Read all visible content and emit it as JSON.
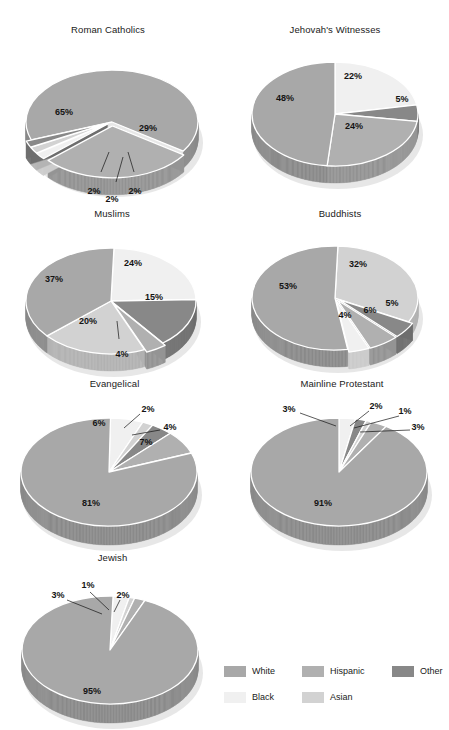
{
  "header": {
    "cut_text": ""
  },
  "legend": {
    "rows": [
      [
        {
          "label": "White",
          "key": "white"
        },
        {
          "label": "Hispanic",
          "key": "hispanic"
        },
        {
          "label": "Other",
          "key": "other"
        }
      ],
      [
        {
          "label": "Black",
          "key": "black"
        },
        {
          "label": "Asian",
          "key": "asian"
        }
      ]
    ]
  },
  "colors": {
    "white": "#a8a8a8",
    "black": "#f0f0f0",
    "hispanic": "#b0b0b0",
    "asian": "#d2d2d2",
    "other": "#888888",
    "white_side": "#8c8c8c",
    "black_side": "#cccccc",
    "hispanic_side": "#949494",
    "asian_side": "#b4b4b4",
    "other_side": "#6e6e6e",
    "edge": "#ffffff",
    "text": "#141414"
  },
  "chart_data": [
    {
      "type": "pie",
      "title": "Roman Catholics",
      "categories": [
        "White",
        "Hispanic",
        "Black",
        "Asian",
        "Other"
      ],
      "values": [
        65,
        29,
        2,
        2,
        2
      ],
      "labels": [
        "65%",
        "29%",
        "2%",
        "2%",
        "2%"
      ],
      "exploded": [
        false,
        true,
        true,
        true,
        true
      ],
      "note": "3-D pie; small slices labeled with leader lines below"
    },
    {
      "type": "pie",
      "title": "Jehovah's Witnesses",
      "categories": [
        "Black",
        "Other",
        "Hispanic",
        "White"
      ],
      "values": [
        22,
        5,
        24,
        48
      ],
      "labels": [
        "22%",
        "5%",
        "24%",
        "48%"
      ],
      "exploded": [
        false,
        false,
        false,
        false
      ]
    },
    {
      "type": "pie",
      "title": "Muslims",
      "categories": [
        "Black",
        "Other",
        "Hispanic",
        "Asian",
        "White"
      ],
      "values": [
        24,
        15,
        4,
        20,
        37
      ],
      "labels": [
        "24%",
        "15%",
        "4%",
        "20%",
        "37%"
      ],
      "exploded": [
        false,
        false,
        true,
        false,
        false
      ]
    },
    {
      "type": "pie",
      "title": "Buddhists",
      "categories": [
        "Asian",
        "Other",
        "Hispanic",
        "Black",
        "White"
      ],
      "values": [
        32,
        5,
        6,
        4,
        53
      ],
      "labels": [
        "32%",
        "5%",
        "6%",
        "4%",
        "53%"
      ],
      "exploded": [
        false,
        true,
        true,
        true,
        false
      ]
    },
    {
      "type": "pie",
      "title": "Evangelical",
      "categories": [
        "Black",
        "Asian",
        "Other",
        "Hispanic",
        "White"
      ],
      "values": [
        6,
        2,
        4,
        7,
        81
      ],
      "labels": [
        "6%",
        "2%",
        "4%",
        "7%",
        "81%"
      ],
      "exploded": [
        false,
        false,
        false,
        false,
        false
      ]
    },
    {
      "type": "pie",
      "title": "Mainline Protestant",
      "categories": [
        "Black",
        "Other",
        "Asian",
        "Hispanic",
        "White"
      ],
      "values": [
        3,
        2,
        1,
        3,
        91
      ],
      "labels": [
        "3%",
        "2%",
        "1%",
        "3%",
        "91%"
      ],
      "exploded": [
        false,
        false,
        false,
        false,
        false
      ]
    },
    {
      "type": "pie",
      "title": "Jewish",
      "categories": [
        "Black",
        "Asian",
        "Hispanic",
        "White"
      ],
      "values": [
        3,
        1,
        2,
        95
      ],
      "labels": [
        "3%",
        "1%",
        "2%",
        "95%"
      ],
      "exploded": [
        false,
        false,
        false,
        false
      ]
    }
  ],
  "charts_layout": [
    {
      "id": "roman-catholics",
      "x": 8,
      "y": 24,
      "w": 200,
      "h": 180,
      "cx": 104,
      "cy": 98,
      "rx": 86,
      "ry": 52,
      "depth": 17,
      "start": 160,
      "slices": [
        {
          "key": "white",
          "label": "65%",
          "lx": 56,
          "ly": 89,
          "explode": 0
        },
        {
          "key": "hispanic",
          "label": "29%",
          "lx": 140,
          "ly": 105,
          "explode": 7,
          "midoff": 2
        },
        {
          "key": "black",
          "label": "2%",
          "lx": 86,
          "ly": 168,
          "explode": 6,
          "leader": [
            93,
            148,
            101,
            128
          ]
        },
        {
          "key": "asian",
          "label": "2%",
          "lx": 104,
          "ly": 176,
          "explode": 6,
          "leader": [
            108,
            158,
            115,
            133
          ]
        },
        {
          "key": "other",
          "label": "2%",
          "lx": 127,
          "ly": 168,
          "explode": 6,
          "leader": [
            126,
            148,
            120,
            128
          ]
        }
      ]
    },
    {
      "id": "jehovahs-witnesses",
      "x": 235,
      "y": 24,
      "w": 200,
      "h": 180,
      "cx": 100,
      "cy": 90,
      "rx": 83,
      "ry": 52,
      "depth": 17,
      "start": 270,
      "slices": [
        {
          "key": "black",
          "label": "22%",
          "lx": 118,
          "ly": 53,
          "explode": 0
        },
        {
          "key": "other",
          "label": "5%",
          "lx": 167,
          "ly": 76,
          "explode": 0
        },
        {
          "key": "hispanic",
          "label": "24%",
          "lx": 119,
          "ly": 103,
          "explode": 0
        },
        {
          "key": "white",
          "label": "48%",
          "lx": 50,
          "ly": 75,
          "explode": 0
        }
      ]
    },
    {
      "id": "muslims",
      "x": 12,
      "y": 208,
      "w": 200,
      "h": 180,
      "cx": 99,
      "cy": 93,
      "rx": 85,
      "ry": 53,
      "depth": 17,
      "start": 272,
      "slices": [
        {
          "key": "black",
          "label": "24%",
          "lx": 121,
          "ly": 56,
          "explode": 0
        },
        {
          "key": "other",
          "label": "15%",
          "lx": 142,
          "ly": 90,
          "explode": 0
        },
        {
          "key": "hispanic",
          "label": "4%",
          "lx": 110,
          "ly": 147,
          "explode": 5,
          "leader": [
            107,
            131,
            105,
            113
          ]
        },
        {
          "key": "asian",
          "label": "20%",
          "lx": 76,
          "ly": 114,
          "explode": 0
        },
        {
          "key": "white",
          "label": "37%",
          "lx": 42,
          "ly": 72,
          "explode": 0
        }
      ]
    },
    {
      "id": "buddhists",
      "x": 240,
      "y": 208,
      "w": 200,
      "h": 180,
      "cx": 95,
      "cy": 90,
      "rx": 83,
      "ry": 52,
      "depth": 17,
      "start": 272,
      "slices": [
        {
          "key": "asian",
          "label": "32%",
          "lx": 118,
          "ly": 57,
          "explode": 0
        },
        {
          "key": "other",
          "label": "5%",
          "lx": 152,
          "ly": 96,
          "explode": 5
        },
        {
          "key": "hispanic",
          "label": "6%",
          "lx": 130,
          "ly": 103,
          "explode": 5
        },
        {
          "key": "black",
          "label": "4%",
          "lx": 105,
          "ly": 108,
          "explode": 5
        },
        {
          "key": "white",
          "label": "53%",
          "lx": 48,
          "ly": 79,
          "explode": 0
        }
      ]
    },
    {
      "id": "evangelical",
      "x": 12,
      "y": 378,
      "w": 205,
      "h": 175,
      "cx": 97,
      "cy": 94,
      "rx": 88,
      "ry": 54,
      "depth": 19,
      "start": 271,
      "slices": [
        {
          "key": "black",
          "label": "6%",
          "lx": 87,
          "ly": 46,
          "explode": 0
        },
        {
          "key": "asian",
          "label": "2%",
          "lx": 136,
          "ly": 32,
          "explode": 0,
          "leader": [
            128,
            36,
            112,
            50
          ]
        },
        {
          "key": "other",
          "label": "4%",
          "lx": 158,
          "ly": 50,
          "explode": 0,
          "leader": [
            148,
            52,
            120,
            57
          ]
        },
        {
          "key": "hispanic",
          "label": "7%",
          "lx": 134,
          "ly": 65,
          "explode": 0
        },
        {
          "key": "white",
          "label": "81%",
          "lx": 79,
          "ly": 126,
          "explode": 0
        }
      ]
    },
    {
      "id": "mainline-protestant",
      "x": 242,
      "y": 378,
      "w": 200,
      "h": 175,
      "cx": 97,
      "cy": 94,
      "rx": 88,
      "ry": 54,
      "depth": 19,
      "start": 270,
      "slices": [
        {
          "key": "black",
          "label": "3%",
          "lx": 47,
          "ly": 32,
          "explode": 0,
          "leader": [
            58,
            35,
            94,
            48
          ]
        },
        {
          "key": "other",
          "label": "2%",
          "lx": 134,
          "ly": 29,
          "explode": 0,
          "leader": [
            127,
            33,
            108,
            48
          ]
        },
        {
          "key": "asian",
          "label": "1%",
          "lx": 163,
          "ly": 34,
          "explode": 0,
          "leader": [
            157,
            38,
            112,
            50
          ]
        },
        {
          "key": "hispanic",
          "label": "3%",
          "lx": 176,
          "ly": 50,
          "explode": 0,
          "leader": [
            168,
            52,
            118,
            54
          ]
        },
        {
          "key": "white",
          "label": "91%",
          "lx": 81,
          "ly": 126,
          "explode": 0
        }
      ]
    },
    {
      "id": "jewish",
      "x": 10,
      "y": 552,
      "w": 205,
      "h": 175,
      "cx": 100,
      "cy": 98,
      "rx": 88,
      "ry": 54,
      "depth": 19,
      "start": 272,
      "slices": [
        {
          "key": "black",
          "label": "3%",
          "lx": 48,
          "ly": 44,
          "explode": 0,
          "leader": [
            57,
            48,
            92,
            62
          ]
        },
        {
          "key": "asian",
          "label": "1%",
          "lx": 78,
          "ly": 34,
          "explode": 0,
          "leader": [
            80,
            40,
            99,
            58
          ]
        },
        {
          "key": "hispanic",
          "label": "2%",
          "lx": 113,
          "ly": 44,
          "explode": 0,
          "leader": [
            110,
            48,
            104,
            60
          ]
        },
        {
          "key": "white",
          "label": "95%",
          "lx": 82,
          "ly": 140,
          "explode": 0
        }
      ]
    }
  ]
}
